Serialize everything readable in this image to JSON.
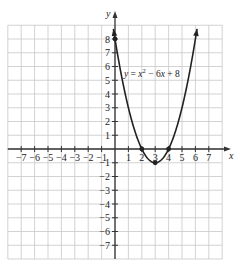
{
  "chart_data": {
    "type": "line",
    "title": "",
    "equation_label": "y = x² − 6x + 8",
    "xlabel": "x",
    "ylabel": "y",
    "xlim": [
      -8,
      8
    ],
    "ylim": [
      -8,
      9
    ],
    "grid": true,
    "x_ticks": [
      -7,
      -6,
      -5,
      -4,
      -3,
      -2,
      -1,
      1,
      2,
      3,
      4,
      5,
      6,
      7
    ],
    "y_ticks": [
      -7,
      -6,
      -5,
      -4,
      -3,
      -2,
      -1,
      1,
      2,
      3,
      4,
      5,
      6,
      7,
      8
    ],
    "series": [
      {
        "name": "y = x^2 - 6x + 8",
        "function": "x^2 - 6x + 8",
        "x": [
          -0.2,
          0,
          1,
          2,
          3,
          4,
          5,
          6,
          6.2
        ],
        "values": [
          9.24,
          8,
          3,
          0,
          -1,
          0,
          3,
          8,
          9.24
        ]
      }
    ],
    "marked_points": [
      {
        "x": 0,
        "y": 8,
        "label": "y-intercept"
      },
      {
        "x": 2,
        "y": 0,
        "label": "x-intercept"
      },
      {
        "x": 4,
        "y": 0,
        "label": "x-intercept"
      },
      {
        "x": 3,
        "y": -1,
        "label": "vertex"
      }
    ]
  },
  "colors": {
    "grid": "#c8c8c8",
    "axis": "#333333",
    "curve": "#222222",
    "background": "#ffffff"
  }
}
